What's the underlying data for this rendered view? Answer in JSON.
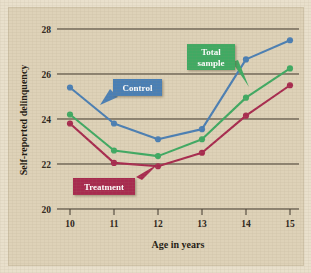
{
  "chart_data": {
    "type": "line",
    "title": "",
    "xlabel": "Age in years",
    "ylabel": "Self-reported delinquency",
    "categories": [
      10,
      11,
      12,
      13,
      14,
      15
    ],
    "x": [
      10,
      11,
      12,
      13,
      14,
      15
    ],
    "xlim": [
      9.6,
      15.4
    ],
    "ylim": [
      20,
      28
    ],
    "yticks": [
      20,
      22,
      24,
      26,
      28
    ],
    "xticks": [
      10,
      11,
      12,
      13,
      14,
      15
    ],
    "grid": "horizontal",
    "legend_position": "inline-callouts",
    "series": [
      {
        "name": "Control",
        "color": "#4a7fb5",
        "values": [
          25.4,
          23.8,
          23.1,
          23.55,
          26.65,
          27.5
        ]
      },
      {
        "name": "Total sample",
        "color": "#3faa63",
        "values": [
          24.2,
          22.6,
          22.35,
          23.1,
          24.95,
          26.25
        ]
      },
      {
        "name": "Treatment",
        "color": "#a82a4f",
        "values": [
          23.8,
          22.05,
          21.9,
          22.5,
          24.15,
          25.5
        ]
      }
    ],
    "annotations": [
      {
        "label": "Control",
        "series": "Control",
        "box_color": "#4a7fb5"
      },
      {
        "label_line1": "Total",
        "label_line2": "sample",
        "series": "Total sample",
        "box_color": "#3faa63"
      },
      {
        "label": "Treatment",
        "series": "Treatment",
        "box_color": "#a82a4f"
      }
    ]
  },
  "axis": {
    "y_title": "Self-reported delinquency",
    "x_title": "Age in years",
    "y_tick_labels": [
      "28",
      "26",
      "24",
      "22",
      "20"
    ],
    "x_tick_labels": [
      "10",
      "11",
      "12",
      "13",
      "14",
      "15"
    ]
  },
  "callouts": {
    "control": "Control",
    "total_sample_line1": "Total",
    "total_sample_line2": "sample",
    "treatment": "Treatment"
  },
  "colors": {
    "control": "#4a7fb5",
    "total_sample": "#3faa63",
    "treatment": "#a82a4f",
    "background": "#ded2b8",
    "mat": "#e9e0cc",
    "gridline": "#3a3328"
  }
}
